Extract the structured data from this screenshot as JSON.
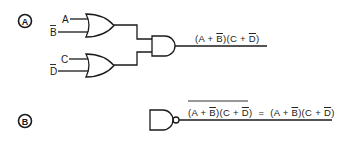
{
  "diagram": {
    "type": "logic-circuit",
    "colors": {
      "stroke": "#1a1a1a",
      "background": "#ffffff"
    },
    "part_a": {
      "label": "A",
      "inputs": [
        {
          "name": "A",
          "negated": false
        },
        {
          "name": "B",
          "negated": true
        },
        {
          "name": "C",
          "negated": false
        },
        {
          "name": "D",
          "negated": true
        }
      ],
      "gates": [
        {
          "id": "or1",
          "type": "OR",
          "inputs": [
            "A",
            "B̄"
          ]
        },
        {
          "id": "or2",
          "type": "OR",
          "inputs": [
            "C",
            "D̄"
          ]
        },
        {
          "id": "and1",
          "type": "AND",
          "inputs": [
            "or1",
            "or2"
          ]
        }
      ],
      "output_expression": "(A + B̄)(C + D̄)",
      "expr_parts": {
        "p1": "(A + ",
        "b": "B",
        "p2": ")(C + ",
        "d": "D",
        "p3": ")"
      }
    },
    "part_b": {
      "label": "B",
      "gates": [
        {
          "id": "nand1",
          "type": "NAND"
        }
      ],
      "output_expression": "NOT((A + B̄)(C + D̄)) = (A + B̄)(C + D̄)",
      "lhs_parts": {
        "p1": "(A + ",
        "b": "B",
        "p2": ")(C + ",
        "d": "D",
        "p3": ")"
      },
      "equals": "=",
      "rhs_parts": {
        "p1": "(A + ",
        "b": "B",
        "p2": ")(C + ",
        "d": "D",
        "p3": ")"
      }
    }
  }
}
